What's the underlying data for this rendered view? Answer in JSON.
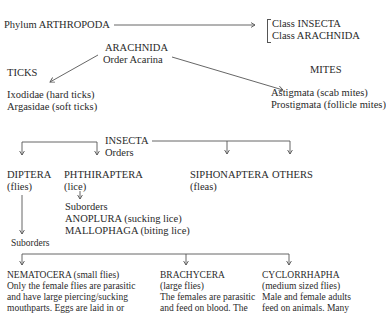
{
  "phylum": {
    "label": "Phylum  ARTHROPODA",
    "classes": [
      "Class INSECTA",
      "Class ARACHNIDA"
    ]
  },
  "arachnida": {
    "title": "ARACHNIDA",
    "order": "Order Acarina",
    "ticks": {
      "title": "TICKS",
      "items": [
        "Ixodidae (hard ticks)",
        "Argasidae (soft ticks)"
      ]
    },
    "mites": {
      "title": "MITES",
      "items": [
        "Astigmata (scab mites)",
        "Prostigmata (follicle mites)"
      ]
    }
  },
  "insecta": {
    "title": "INSECTA",
    "orders_label": "Orders",
    "orders": [
      {
        "name": "DIPTERA",
        "common": "(flies)"
      },
      {
        "name": "PHTHIRAPTERA",
        "common": "(lice)"
      },
      {
        "name": "SIPHONAPTERA",
        "common": "(fleas)"
      },
      {
        "name": "OTHERS",
        "common": ""
      }
    ],
    "phthiraptera_suborders": {
      "label": "Suborders",
      "items": [
        "ANOPLURA (sucking lice)",
        "MALLOPHAGA (biting lice)"
      ]
    },
    "diptera_suborders": {
      "label": "Suborders",
      "items": [
        {
          "name": "NEMATOCERA (small flies)",
          "lines": [
            "Only the female flies are parasitic",
            "and have large piercing/sucking",
            "mouthparts. Eggs are laid in or"
          ]
        },
        {
          "name": "BRACHYCERA",
          "lines": [
            "(large flies)",
            "The females are parasitic",
            "and feed on blood. The"
          ]
        },
        {
          "name": "CYCLORRHAPHA",
          "lines": [
            "(medium sized flies)",
            "Male and female adults",
            "feed on animals. Many"
          ]
        }
      ]
    }
  },
  "colors": {
    "text": "#2a2a2a",
    "lines": "#555555"
  }
}
